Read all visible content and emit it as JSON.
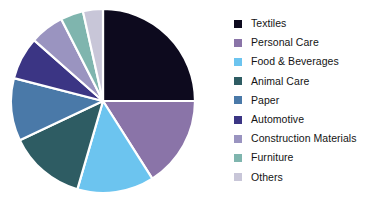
{
  "chart_data": {
    "type": "pie",
    "title": "",
    "subtitle": "",
    "xlabel": "",
    "ylabel": "",
    "grid": false,
    "legend_position": "right",
    "start_angle_deg": 0,
    "direction": "clockwise",
    "categories": [
      "Textiles",
      "Personal Care",
      "Food & Beverages",
      "Animal Care",
      "Paper",
      "Automotive",
      "Construction Materials",
      "Furniture",
      "Others"
    ],
    "values": [
      25.0,
      16.0,
      13.5,
      13.5,
      11.0,
      7.5,
      6.0,
      4.0,
      3.5
    ],
    "colors": [
      "#0d0a1e",
      "#8a74a8",
      "#6cc4ef",
      "#2e5c63",
      "#4a79a8",
      "#3b3584",
      "#9a94c0",
      "#7fb5ae",
      "#c8c6d8"
    ],
    "slices": [
      {
        "label": "Textiles",
        "value": 25.0,
        "color": "#0d0a1e",
        "start_deg": 0,
        "end_deg": 90
      },
      {
        "label": "Personal Care",
        "value": 16.0,
        "color": "#8a74a8",
        "start_deg": 90,
        "end_deg": 147.6
      },
      {
        "label": "Food & Beverages",
        "value": 13.5,
        "color": "#6cc4ef",
        "start_deg": 147.6,
        "end_deg": 196.2
      },
      {
        "label": "Animal Care",
        "value": 13.5,
        "color": "#2e5c63",
        "start_deg": 196.2,
        "end_deg": 244.8
      },
      {
        "label": "Paper",
        "value": 11.0,
        "color": "#4a79a8",
        "start_deg": 244.8,
        "end_deg": 284.4
      },
      {
        "label": "Automotive",
        "value": 7.5,
        "color": "#3b3584",
        "start_deg": 284.4,
        "end_deg": 311.4
      },
      {
        "label": "Construction Materials",
        "value": 6.0,
        "color": "#9a94c0",
        "start_deg": 311.4,
        "end_deg": 333.0
      },
      {
        "label": "Furniture",
        "value": 4.0,
        "color": "#7fb5ae",
        "start_deg": 333.0,
        "end_deg": 347.4
      },
      {
        "label": "Others",
        "value": 3.5,
        "color": "#c8c6d8",
        "start_deg": 347.4,
        "end_deg": 360
      }
    ],
    "separator_color": "#ffffff",
    "background_color": "#ffffff"
  },
  "legend": {
    "items": [
      {
        "label": "Textiles",
        "color": "#0d0a1e"
      },
      {
        "label": "Personal Care",
        "color": "#8a74a8"
      },
      {
        "label": "Food & Beverages",
        "color": "#6cc4ef"
      },
      {
        "label": "Animal Care",
        "color": "#2e5c63"
      },
      {
        "label": "Paper",
        "color": "#4a79a8"
      },
      {
        "label": "Automotive",
        "color": "#3b3584"
      },
      {
        "label": "Construction Materials",
        "color": "#9a94c0"
      },
      {
        "label": "Furniture",
        "color": "#7fb5ae"
      },
      {
        "label": "Others",
        "color": "#c8c6d8"
      }
    ]
  }
}
